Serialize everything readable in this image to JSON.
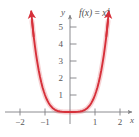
{
  "figure": {
    "title": "",
    "function_label_parts": {
      "f": "f",
      "paren_open": "(",
      "var": "x",
      "paren_close": ")",
      "equals": " = ",
      "base": "x",
      "exponent": "4"
    },
    "function_label": "f(x) = x4",
    "axis_labels": {
      "x": "x",
      "y": "y"
    },
    "colors": {
      "curve": "#d6303a",
      "axis": "#808083",
      "tick_text": "#58585a",
      "background": "#ffffff"
    }
  },
  "chart_data": {
    "type": "line",
    "title": "",
    "subtitle": "",
    "xlabel": "x",
    "ylabel": "y",
    "legend": [
      "f(x) = x^4"
    ],
    "legend_position": "top-right",
    "grid": false,
    "xlim": [
      -2.6,
      2.55
    ],
    "ylim": [
      -0.45,
      5.9
    ],
    "xticks": [
      -2,
      -1,
      1,
      2
    ],
    "xtick_labels": [
      "−2",
      "−1",
      "1",
      "2"
    ],
    "yticks": [
      1,
      2,
      3,
      4,
      5
    ],
    "ytick_labels": [
      "1",
      "2",
      "3",
      "4",
      "5"
    ],
    "series": [
      {
        "name": "f(x) = x^4",
        "expression": "x^4",
        "color": "#d6303a",
        "arrow_start": true,
        "arrow_end": true,
        "x": [
          -1.52,
          -1.45,
          -1.4,
          -1.35,
          -1.3,
          -1.25,
          -1.2,
          -1.15,
          -1.1,
          -1.05,
          -1.0,
          -0.95,
          -0.9,
          -0.85,
          -0.8,
          -0.7,
          -0.6,
          -0.5,
          -0.4,
          -0.3,
          -0.2,
          -0.1,
          0.0,
          0.1,
          0.2,
          0.3,
          0.4,
          0.5,
          0.6,
          0.7,
          0.8,
          0.85,
          0.9,
          0.95,
          1.0,
          1.05,
          1.1,
          1.15,
          1.2,
          1.25,
          1.3,
          1.35,
          1.4,
          1.45,
          1.52
        ],
        "y": [
          5.34,
          4.42,
          3.84,
          3.32,
          2.86,
          2.44,
          2.07,
          1.75,
          1.46,
          1.22,
          1.0,
          0.81,
          0.66,
          0.52,
          0.41,
          0.24,
          0.13,
          0.06,
          0.03,
          0.01,
          0.0,
          0.0,
          0.0,
          0.0,
          0.0,
          0.01,
          0.03,
          0.06,
          0.13,
          0.24,
          0.41,
          0.52,
          0.66,
          0.81,
          1.0,
          1.22,
          1.46,
          1.75,
          2.07,
          2.44,
          2.86,
          3.32,
          3.84,
          4.42,
          5.34
        ]
      }
    ]
  }
}
